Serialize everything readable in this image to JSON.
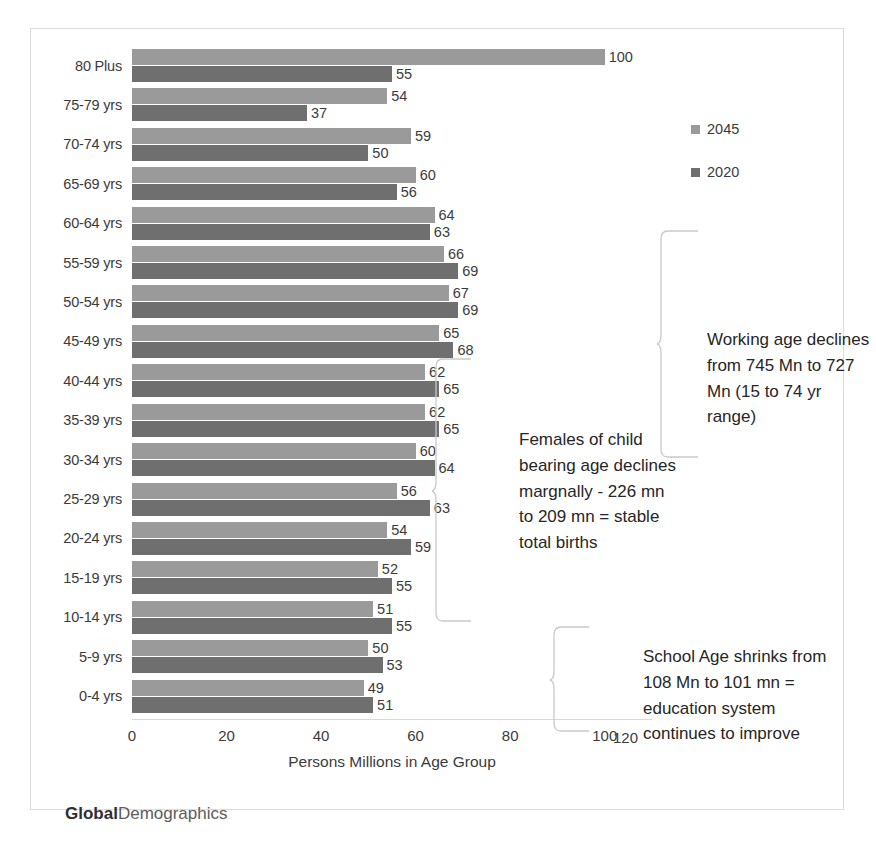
{
  "chart_data": {
    "type": "bar",
    "orientation": "horizontal",
    "title": "",
    "xlabel": "Persons Millions in Age Group",
    "ylabel": "",
    "xlim": [
      0,
      110
    ],
    "xticks": [
      0,
      20,
      40,
      60,
      80,
      100
    ],
    "stray_tick_label": "120",
    "grid": false,
    "legend_position": "top-right",
    "categories": [
      "80 Plus",
      "75-79 yrs",
      "70-74 yrs",
      "65-69 yrs",
      "60-64 yrs",
      "55-59 yrs",
      "50-54 yrs",
      "45-49 yrs",
      "40-44 yrs",
      "35-39 yrs",
      "30-34 yrs",
      "25-29 yrs",
      "20-24 yrs",
      "15-19 yrs",
      "10-14 yrs",
      "5-9 yrs",
      "0-4 yrs"
    ],
    "series": [
      {
        "name": "2045",
        "color": "#9a9a9a",
        "values": [
          100,
          54,
          59,
          60,
          64,
          66,
          67,
          65,
          62,
          62,
          60,
          56,
          54,
          52,
          51,
          50,
          49
        ]
      },
      {
        "name": "2020",
        "color": "#6f6f6f",
        "values": [
          55,
          37,
          50,
          56,
          63,
          69,
          69,
          68,
          65,
          65,
          64,
          63,
          59,
          55,
          55,
          53,
          51
        ]
      }
    ]
  },
  "legend": {
    "items": [
      {
        "label": "2045",
        "color": "#9a9a9a"
      },
      {
        "label": "2020",
        "color": "#6f6f6f"
      }
    ]
  },
  "annotations": {
    "working_age": "Working age declines from 745 Mn to 727 Mn  (15 to 74 yr range)",
    "females": "Females of child bearing age declines margnally -  226 mn to 209 mn = stable total births",
    "school_age": "School Age shrinks from 108 Mn to 101 mn = education system continues  to improve"
  },
  "footer": {
    "brand_bold": "Global",
    "brand_light": "Demographics"
  }
}
